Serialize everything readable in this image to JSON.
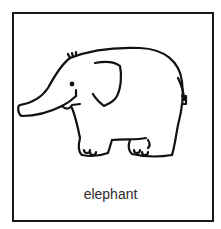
{
  "card": {
    "label": "elephant",
    "illustration": "elephant-icon",
    "border_color": "#1a1a1a"
  }
}
